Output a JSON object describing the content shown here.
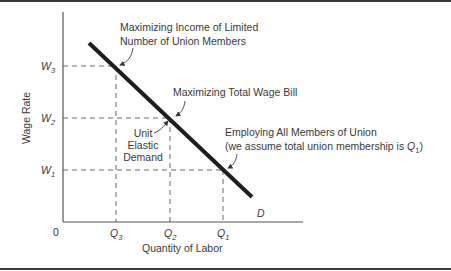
{
  "diagram": {
    "type": "labor-demand-curve",
    "axes": {
      "y_label": "Wage Rate",
      "x_label": "Quantity of Labor",
      "origin": "0"
    },
    "y_ticks": [
      {
        "name": "W",
        "sub": "3"
      },
      {
        "name": "W",
        "sub": "2"
      },
      {
        "name": "W",
        "sub": "1"
      }
    ],
    "x_ticks": [
      {
        "name": "Q",
        "sub": "3"
      },
      {
        "name": "Q",
        "sub": "2"
      },
      {
        "name": "Q",
        "sub": "1"
      }
    ],
    "curve_label": "D",
    "annotations": {
      "income": {
        "line1": "Maximizing Income of Limited",
        "line2": "Number of Union Members"
      },
      "wage_bill": {
        "line1": "Maximizing Total Wage Bill"
      },
      "unit_elastic": {
        "line1": "Unit",
        "line2": "Elastic",
        "line3": "Demand"
      },
      "employing": {
        "line1": "Employing All Members of Union",
        "line2_prefix": "(we assume total union membership is ",
        "line2_q": "Q",
        "line2_sub": "1",
        "line2_suffix": ")"
      }
    },
    "colors": {
      "axis": "#555555",
      "curve": "#1e1e1e",
      "dashed": "#555555",
      "text": "#3a3a3a",
      "border": "#3a3a3a"
    }
  }
}
